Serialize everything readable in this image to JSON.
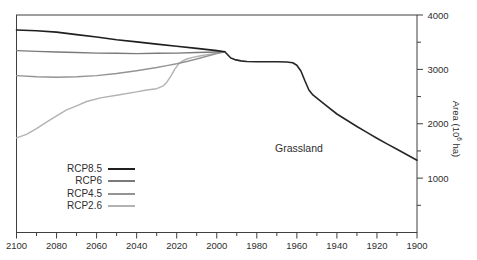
{
  "figure": {
    "background": "#ffffff",
    "axis_color": "#3f3f3f",
    "text_color": "#2e2e2e"
  },
  "chart_data": {
    "type": "line",
    "title": "",
    "annotation": "Grassland",
    "xlabel": "",
    "ylabel": "Area (10^6 ha)",
    "ylabel_parts": {
      "prefix": "Area (10",
      "sup": "6",
      "suffix": " ha)"
    },
    "x_axis": {
      "lim": [
        2100,
        1900
      ],
      "reversed": true,
      "major_ticks": [
        2100,
        2080,
        2060,
        2040,
        2020,
        2000,
        1980,
        1960,
        1940,
        1920,
        1900
      ],
      "minor_ticks": [
        2090,
        2070,
        2050,
        2030,
        2010,
        1990,
        1970,
        1950,
        1930,
        1910
      ]
    },
    "y_axis": {
      "lim": [
        0,
        4000
      ],
      "side": "right",
      "major_ticks": [
        1000,
        2000,
        3000,
        4000
      ],
      "minor_ticks": [
        500,
        1500,
        2500,
        3500
      ]
    },
    "grid": false,
    "legend": {
      "position": "lower-left-inside",
      "order": [
        "RCP8.5",
        "RCP6",
        "RCP4.5",
        "RCP2.6"
      ]
    },
    "series": [
      {
        "name": "historical",
        "color": "#262626",
        "width": 1.6,
        "in_legend": false,
        "points": [
          [
            1900,
            1330
          ],
          [
            1905,
            1430
          ],
          [
            1910,
            1530
          ],
          [
            1915,
            1630
          ],
          [
            1920,
            1735
          ],
          [
            1925,
            1840
          ],
          [
            1930,
            1950
          ],
          [
            1935,
            2065
          ],
          [
            1940,
            2180
          ],
          [
            1945,
            2325
          ],
          [
            1950,
            2470
          ],
          [
            1952,
            2530
          ],
          [
            1954,
            2620
          ],
          [
            1956,
            2790
          ],
          [
            1958,
            2970
          ],
          [
            1960,
            3075
          ],
          [
            1962,
            3120
          ],
          [
            1965,
            3135
          ],
          [
            1970,
            3140
          ],
          [
            1975,
            3140
          ],
          [
            1980,
            3140
          ],
          [
            1985,
            3145
          ],
          [
            1988,
            3155
          ],
          [
            1991,
            3180
          ],
          [
            1993,
            3210
          ],
          [
            1996,
            3325
          ]
        ]
      },
      {
        "name": "RCP2.6",
        "color": "#b2b2b2",
        "width": 1.4,
        "in_legend": true,
        "points": [
          [
            1996,
            3325
          ],
          [
            2000,
            3300
          ],
          [
            2004,
            3275
          ],
          [
            2008,
            3250
          ],
          [
            2012,
            3220
          ],
          [
            2015,
            3190
          ],
          [
            2017,
            3155
          ],
          [
            2019,
            3100
          ],
          [
            2021,
            3000
          ],
          [
            2023,
            2870
          ],
          [
            2025,
            2760
          ],
          [
            2027,
            2690
          ],
          [
            2030,
            2645
          ],
          [
            2035,
            2620
          ],
          [
            2040,
            2585
          ],
          [
            2050,
            2525
          ],
          [
            2058,
            2475
          ],
          [
            2065,
            2410
          ],
          [
            2070,
            2330
          ],
          [
            2075,
            2255
          ],
          [
            2080,
            2145
          ],
          [
            2085,
            2030
          ],
          [
            2090,
            1910
          ],
          [
            2095,
            1805
          ],
          [
            2100,
            1740
          ]
        ]
      },
      {
        "name": "RCP4.5",
        "color": "#949494",
        "width": 1.4,
        "in_legend": true,
        "points": [
          [
            1996,
            3325
          ],
          [
            2000,
            3290
          ],
          [
            2005,
            3240
          ],
          [
            2010,
            3190
          ],
          [
            2015,
            3145
          ],
          [
            2020,
            3105
          ],
          [
            2025,
            3070
          ],
          [
            2030,
            3035
          ],
          [
            2040,
            2975
          ],
          [
            2050,
            2925
          ],
          [
            2060,
            2885
          ],
          [
            2070,
            2865
          ],
          [
            2080,
            2855
          ],
          [
            2090,
            2865
          ],
          [
            2100,
            2885
          ]
        ]
      },
      {
        "name": "RCP6",
        "color": "#7a7a7a",
        "width": 1.4,
        "in_legend": true,
        "points": [
          [
            1996,
            3325
          ],
          [
            2000,
            3320
          ],
          [
            2010,
            3310
          ],
          [
            2020,
            3300
          ],
          [
            2030,
            3295
          ],
          [
            2040,
            3290
          ],
          [
            2050,
            3295
          ],
          [
            2060,
            3300
          ],
          [
            2070,
            3310
          ],
          [
            2080,
            3320
          ],
          [
            2090,
            3330
          ],
          [
            2100,
            3345
          ]
        ]
      },
      {
        "name": "RCP8.5",
        "color": "#1f1f1f",
        "width": 1.6,
        "in_legend": true,
        "points": [
          [
            1996,
            3325
          ],
          [
            2000,
            3345
          ],
          [
            2010,
            3385
          ],
          [
            2020,
            3425
          ],
          [
            2030,
            3465
          ],
          [
            2040,
            3505
          ],
          [
            2050,
            3545
          ],
          [
            2060,
            3595
          ],
          [
            2070,
            3640
          ],
          [
            2080,
            3685
          ],
          [
            2090,
            3710
          ],
          [
            2100,
            3725
          ]
        ]
      }
    ]
  }
}
